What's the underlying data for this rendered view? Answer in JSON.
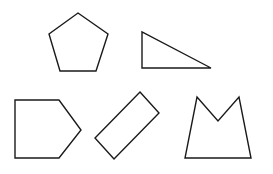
{
  "canvas": {
    "width": 273,
    "height": 174,
    "background": "#ffffff"
  },
  "stroke_color": "#1a1a1a",
  "shapes": [
    {
      "name": "regular-pentagon",
      "points": "78,13 108,34 96,71 60,71 49,34"
    },
    {
      "name": "right-triangle",
      "points": "142,32 142,68 211,68"
    },
    {
      "name": "house-pentagon",
      "points": "15,100 59,100 81,130 59,158 15,158"
    },
    {
      "name": "tilted-rectangle",
      "points": "140,92 159,113 114,159 95,138"
    },
    {
      "name": "crown-concave-pentagon",
      "points": "197,97 218,121 239,97 251,158 185,158"
    }
  ]
}
